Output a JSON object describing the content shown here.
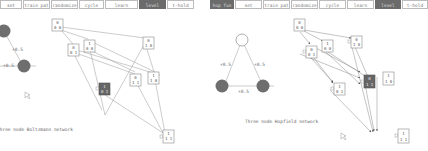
{
  "left_panel": {
    "toolbar": [
      {
        "label": "set",
        "width": 22,
        "active": false
      },
      {
        "label": "train pat",
        "width": 27,
        "active": false
      },
      {
        "label": "randomize",
        "width": 27,
        "active": false
      },
      {
        "label": "cycle",
        "width": 25,
        "active": false
      },
      {
        "label": "learn",
        "width": 33,
        "active": false
      },
      {
        "label": "level",
        "width": 27,
        "active": true
      },
      {
        "label": "t-hold",
        "width": 27,
        "active": false
      }
    ],
    "caption": "Three node Boltzmann network",
    "edge_weights": [
      "+0.5",
      "+0.5"
    ],
    "states": [
      {
        "top": "0",
        "bottom": "0 0",
        "dark": false
      },
      {
        "top": "0",
        "bottom": "0 1",
        "dark": false
      },
      {
        "top": "1",
        "bottom": "0 0",
        "dark": false
      },
      {
        "top": "0",
        "bottom": "1 0",
        "dark": false
      },
      {
        "top": "1",
        "bottom": "0 1",
        "dark": true
      },
      {
        "top": "0",
        "bottom": "1 1",
        "dark": false
      },
      {
        "top": "1",
        "bottom": "1 0",
        "dark": false
      },
      {
        "top": "1",
        "bottom": "1 1",
        "dark": false
      }
    ]
  },
  "right_panel": {
    "toolbar": [
      {
        "label": "hop fun",
        "width": 26,
        "active": true
      },
      {
        "label": "set",
        "width": 26,
        "active": false
      },
      {
        "label": "train pat",
        "width": 27,
        "active": false
      },
      {
        "label": "randomize",
        "width": 27,
        "active": false
      },
      {
        "label": "cycle",
        "width": 27,
        "active": false
      },
      {
        "label": "learn",
        "width": 27,
        "active": false
      },
      {
        "label": "level",
        "width": 26,
        "active": true
      },
      {
        "label": "t-hold",
        "width": 26,
        "active": false
      }
    ],
    "caption": "Three node Hopfield network",
    "edge_weights": [
      "+0.5",
      "+0.5",
      "+0.5"
    ],
    "states": [
      {
        "top": "0",
        "bottom": "0 0",
        "dark": false
      },
      {
        "top": "0",
        "bottom": "0 1",
        "dark": false
      },
      {
        "top": "1",
        "bottom": "0 0",
        "dark": false
      },
      {
        "top": "0",
        "bottom": "1 0",
        "dark": false
      },
      {
        "top": "0",
        "bottom": "1 1",
        "dark": true
      },
      {
        "top": "1",
        "bottom": "1 0",
        "dark": false
      },
      {
        "top": "1",
        "bottom": "0 1",
        "dark": false
      },
      {
        "top": "1",
        "bottom": "1 1",
        "dark": false
      }
    ]
  }
}
